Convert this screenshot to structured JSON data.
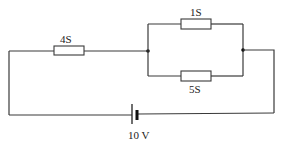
{
  "diagram": {
    "type": "electric-circuit",
    "components": [
      {
        "id": "R1",
        "kind": "resistor",
        "label": "4S",
        "position": "series-left-top"
      },
      {
        "id": "R2",
        "kind": "resistor",
        "label": "1S",
        "position": "parallel-upper-branch"
      },
      {
        "id": "R3",
        "kind": "resistor",
        "label": "5S",
        "position": "parallel-lower-branch"
      },
      {
        "id": "B1",
        "kind": "battery",
        "label": "10 V",
        "position": "bottom"
      }
    ],
    "nodes": [
      {
        "id": "N1",
        "label": "left-junction"
      },
      {
        "id": "N2",
        "label": "right-junction"
      }
    ],
    "colors": {
      "wire": "#3a3a3a",
      "background": "#ffffff",
      "text": "#222222"
    }
  }
}
